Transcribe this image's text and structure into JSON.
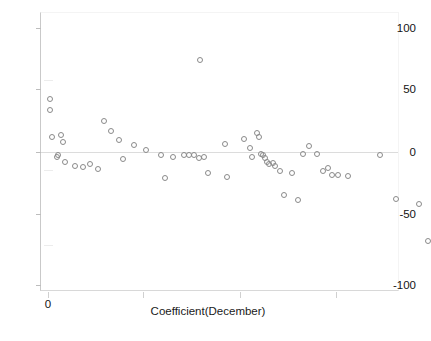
{
  "chart_data": {
    "type": "scatter",
    "title": "",
    "subtitle": "",
    "xlabel": "Coefficient(December)",
    "ylabel": "",
    "xlim": [
      0,
      4
    ],
    "ylim": [
      -100,
      100
    ],
    "grid": false,
    "legend": null,
    "marker_style": "open-circle",
    "marker_color": "#8a8a8a",
    "y_ticks": [
      100,
      50,
      0,
      -50,
      -100
    ],
    "y_tick_labels": [
      "100",
      "50",
      "0",
      "-50",
      "-100"
    ],
    "x_ticks": [
      0,
      1,
      2,
      3
    ],
    "x_tick_labels": [
      "0",
      "",
      "",
      ""
    ],
    "x": [
      0.02,
      0.02,
      0.04,
      0.09,
      0.13,
      0.16,
      0.1,
      0.18,
      0.28,
      0.36,
      0.44,
      0.52,
      0.58,
      0.66,
      0.74,
      0.78,
      0.9,
      1.02,
      1.18,
      1.3,
      1.42,
      1.47,
      1.52,
      1.57,
      1.62,
      1.67,
      1.84,
      1.58,
      1.86,
      2.04,
      2.1,
      2.12,
      2.18,
      2.2,
      2.22,
      2.24,
      2.26,
      2.28,
      2.3,
      2.34,
      2.36,
      2.42,
      2.46,
      2.54,
      2.6,
      2.66,
      2.72,
      2.8,
      2.86,
      2.92,
      2.96,
      3.02,
      3.12,
      3.46,
      3.62,
      3.86,
      3.96,
      1.22
    ],
    "y": [
      45,
      36,
      15,
      0,
      17,
      11,
      1,
      -4,
      -7,
      -8,
      -6,
      -10,
      28,
      20,
      13,
      -2,
      9,
      5,
      1,
      0,
      1,
      1,
      1,
      -1,
      0,
      -13,
      10,
      75,
      -16,
      14,
      7,
      0,
      18,
      15,
      2,
      1,
      -1,
      -4,
      -6,
      -5,
      -7,
      -11,
      -30,
      -13,
      -34,
      2,
      8,
      2,
      -11,
      -9,
      -14,
      -14,
      -15,
      1,
      -33,
      -37,
      -66,
      -17
    ],
    "n_points": 58,
    "points": [
      {
        "x": 0.02,
        "y": 45
      },
      {
        "x": 0.02,
        "y": 36
      },
      {
        "x": 0.04,
        "y": 15
      },
      {
        "x": 0.09,
        "y": 0
      },
      {
        "x": 0.13,
        "y": 17
      },
      {
        "x": 0.16,
        "y": 11
      },
      {
        "x": 0.1,
        "y": 1
      },
      {
        "x": 0.18,
        "y": -4
      },
      {
        "x": 0.28,
        "y": -7
      },
      {
        "x": 0.36,
        "y": -8
      },
      {
        "x": 0.44,
        "y": -6
      },
      {
        "x": 0.52,
        "y": -10
      },
      {
        "x": 0.58,
        "y": 28
      },
      {
        "x": 0.66,
        "y": 20
      },
      {
        "x": 0.74,
        "y": 13
      },
      {
        "x": 0.78,
        "y": -2
      },
      {
        "x": 0.9,
        "y": 9
      },
      {
        "x": 1.02,
        "y": 5
      },
      {
        "x": 1.18,
        "y": 1
      },
      {
        "x": 1.3,
        "y": 0
      },
      {
        "x": 1.42,
        "y": 1
      },
      {
        "x": 1.47,
        "y": 1
      },
      {
        "x": 1.52,
        "y": 1
      },
      {
        "x": 1.57,
        "y": -1
      },
      {
        "x": 1.62,
        "y": 0
      },
      {
        "x": 1.67,
        "y": -13
      },
      {
        "x": 1.84,
        "y": 10
      },
      {
        "x": 1.58,
        "y": 75
      },
      {
        "x": 1.86,
        "y": -16
      },
      {
        "x": 2.04,
        "y": 14
      },
      {
        "x": 2.1,
        "y": 7
      },
      {
        "x": 2.12,
        "y": 0
      },
      {
        "x": 2.18,
        "y": 18
      },
      {
        "x": 2.2,
        "y": 15
      },
      {
        "x": 2.22,
        "y": 2
      },
      {
        "x": 2.24,
        "y": 1
      },
      {
        "x": 2.26,
        "y": -1
      },
      {
        "x": 2.28,
        "y": -4
      },
      {
        "x": 2.3,
        "y": -6
      },
      {
        "x": 2.34,
        "y": -5
      },
      {
        "x": 2.36,
        "y": -7
      },
      {
        "x": 2.42,
        "y": -11
      },
      {
        "x": 2.46,
        "y": -30
      },
      {
        "x": 2.54,
        "y": -13
      },
      {
        "x": 2.6,
        "y": -34
      },
      {
        "x": 2.66,
        "y": 2
      },
      {
        "x": 2.72,
        "y": 8
      },
      {
        "x": 2.8,
        "y": 2
      },
      {
        "x": 2.86,
        "y": -11
      },
      {
        "x": 2.92,
        "y": -9
      },
      {
        "x": 2.96,
        "y": -14
      },
      {
        "x": 3.02,
        "y": -14
      },
      {
        "x": 3.12,
        "y": -15
      },
      {
        "x": 3.46,
        "y": 1
      },
      {
        "x": 3.62,
        "y": -33
      },
      {
        "x": 3.86,
        "y": -37
      },
      {
        "x": 3.96,
        "y": -66
      },
      {
        "x": 1.22,
        "y": -17
      }
    ]
  },
  "axes": {
    "y_labels": [
      "100",
      "50",
      "0",
      "-50",
      "-100"
    ],
    "x_labels": [
      "0"
    ],
    "x_title": "Coefficient(December)"
  },
  "style": {
    "background": "#ffffff",
    "marker_stroke": "#8a8a8a",
    "axis_line": "#c9c9c9",
    "zero_line": "#dcdcdc",
    "text_color": "#141414"
  }
}
